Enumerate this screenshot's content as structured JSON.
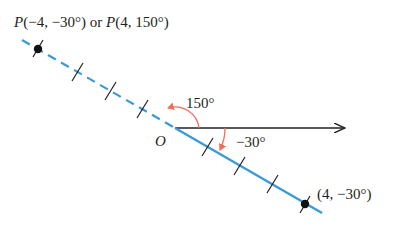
{
  "diagram": {
    "type": "polar-coordinates-illustration",
    "colors": {
      "axis": "#231f20",
      "line": "#3a9ad9",
      "arc": "#f26d5b",
      "point": "#111111"
    },
    "labels": {
      "point_top_P1": "P",
      "point_top_coords1": "(−4, −30°)",
      "point_top_or": " or ",
      "point_top_P2": "P",
      "point_top_coords2": "(4, 150°)",
      "origin": "O",
      "angle_positive": "150°",
      "angle_negative": "−30°",
      "point_bottom": "(4, −30°)"
    },
    "points": [
      {
        "name": "P",
        "polar": [
          "−4",
          "−30°"
        ],
        "alt_polar": [
          "4",
          "150°"
        ]
      },
      {
        "name": "Q",
        "polar": [
          "4",
          "−30°"
        ]
      }
    ],
    "tick_marks_per_side": 3
  }
}
